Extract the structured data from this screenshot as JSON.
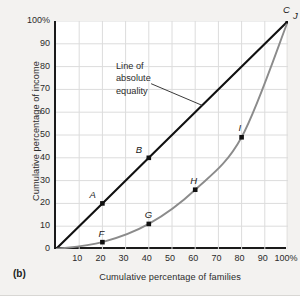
{
  "figure": {
    "panel_letter": "(b)",
    "annotation_lines": [
      "Line of",
      "absolute",
      "equality"
    ],
    "annotation_text": "Line of absolute equality"
  },
  "chart_data": {
    "type": "line",
    "title": "",
    "xlabel": "Cumulative percentage of families",
    "ylabel": "Cumulative percentage of income",
    "xlim": [
      0,
      100
    ],
    "ylim": [
      0,
      100
    ],
    "grid": true,
    "legend": "none",
    "xticks": [
      {
        "value": 10,
        "label": "10"
      },
      {
        "value": 20,
        "label": "20"
      },
      {
        "value": 30,
        "label": "30"
      },
      {
        "value": 40,
        "label": "40"
      },
      {
        "value": 50,
        "label": "50"
      },
      {
        "value": 60,
        "label": "60"
      },
      {
        "value": 70,
        "label": "70"
      },
      {
        "value": 80,
        "label": "80"
      },
      {
        "value": 90,
        "label": "90"
      },
      {
        "value": 100,
        "label": "100%"
      }
    ],
    "yticks": [
      {
        "value": 0,
        "label": "0"
      },
      {
        "value": 10,
        "label": "10"
      },
      {
        "value": 20,
        "label": "20"
      },
      {
        "value": 30,
        "label": "30"
      },
      {
        "value": 40,
        "label": "40"
      },
      {
        "value": 50,
        "label": "50"
      },
      {
        "value": 60,
        "label": "60"
      },
      {
        "value": 70,
        "label": "70"
      },
      {
        "value": 80,
        "label": "80"
      },
      {
        "value": 90,
        "label": "90"
      },
      {
        "value": 100,
        "label": "100%"
      }
    ],
    "series": [
      {
        "name": "Line of absolute equality",
        "color": "#111111",
        "x": [
          0,
          20,
          40,
          100
        ],
        "y": [
          0,
          20,
          40,
          100
        ],
        "points": [
          {
            "label": "A",
            "x": 20,
            "y": 20
          },
          {
            "label": "B",
            "x": 40,
            "y": 40
          },
          {
            "label": "C",
            "x": 100,
            "y": 100
          }
        ]
      },
      {
        "name": "Lorenz curve",
        "color": "#8b8b8b",
        "x": [
          0,
          20,
          40,
          60,
          80,
          100
        ],
        "y": [
          0,
          3,
          11,
          26,
          49,
          100
        ],
        "points": [
          {
            "label": "F",
            "x": 20,
            "y": 3
          },
          {
            "label": "G",
            "x": 40,
            "y": 11
          },
          {
            "label": "H",
            "x": 60,
            "y": 26
          },
          {
            "label": "I",
            "x": 80,
            "y": 49
          },
          {
            "label": "J",
            "x": 100,
            "y": 100
          }
        ]
      }
    ],
    "annotations": [
      {
        "text": "Line of absolute equality",
        "x": 30,
        "y": 75,
        "leader_to": {
          "x": 63,
          "y": 63
        }
      }
    ]
  },
  "colors": {
    "equality_line": "#111111",
    "lorenz_curve": "#8b8b8b",
    "grid": "#dcdcdc",
    "axis": "#1a1a1a",
    "page_background": "#f3f2f0",
    "plot_background": "#ffffff",
    "text": "#2b2b2b"
  }
}
